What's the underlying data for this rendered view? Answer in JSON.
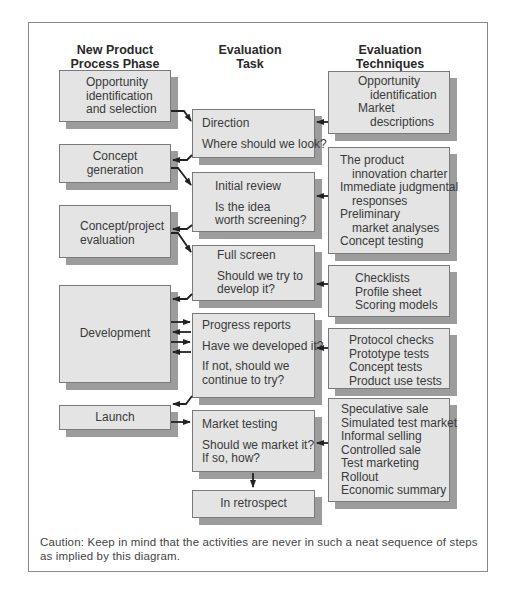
{
  "headers": {
    "phase": [
      "New Product",
      "Process Phase"
    ],
    "task": [
      "Evaluation",
      "Task"
    ],
    "techniques": [
      "Evaluation",
      "Techniques"
    ]
  },
  "phases": [
    {
      "id": "opportunity",
      "lines": [
        "Opportunity",
        "identification",
        "and selection"
      ]
    },
    {
      "id": "concept-generation",
      "lines": [
        "Concept",
        "generation"
      ]
    },
    {
      "id": "concept-project-evaluation",
      "lines": [
        "Concept/project",
        "evaluation"
      ]
    },
    {
      "id": "development",
      "lines": [
        "Development"
      ]
    },
    {
      "id": "launch",
      "lines": [
        "Launch"
      ]
    }
  ],
  "tasks": [
    {
      "id": "direction",
      "title": "Direction",
      "question": [
        "Where should we look?"
      ]
    },
    {
      "id": "initial-review",
      "title": "Initial review",
      "question": [
        "Is the idea",
        "worth screening?"
      ]
    },
    {
      "id": "full-screen",
      "title": "Full screen",
      "question": [
        "Should we try to",
        "develop it?"
      ]
    },
    {
      "id": "progress-reports",
      "title": "Progress reports",
      "question": [
        "Have we developed it?"
      ],
      "extra": [
        "If not, should we",
        "continue to try?"
      ]
    },
    {
      "id": "market-testing",
      "title": "Market testing",
      "question": [
        "Should we market it?",
        "If so, how?"
      ]
    },
    {
      "id": "in-retrospect",
      "title": "In retrospect"
    }
  ],
  "techniques": [
    {
      "id": "t1",
      "items": [
        {
          "text": "Opportunity",
          "indent": false
        },
        {
          "text": "identification",
          "indent": true
        },
        {
          "text": "Market",
          "indent": false
        },
        {
          "text": "descriptions",
          "indent": true
        }
      ]
    },
    {
      "id": "t2",
      "items": [
        {
          "text": "The product",
          "indent": false
        },
        {
          "text": "innovation charter",
          "indent": true
        },
        {
          "text": "Immediate judgmental",
          "indent": false
        },
        {
          "text": "responses",
          "indent": true
        },
        {
          "text": "Preliminary",
          "indent": false
        },
        {
          "text": "market analyses",
          "indent": true
        },
        {
          "text": "Concept testing",
          "indent": false
        }
      ]
    },
    {
      "id": "t3",
      "items": [
        "Checklists",
        "Profile sheet",
        "Scoring models"
      ]
    },
    {
      "id": "t4",
      "items": [
        "Protocol checks",
        "Prototype tests",
        "Concept tests",
        "Product use tests"
      ]
    },
    {
      "id": "t5",
      "items": [
        "Speculative sale",
        "Simulated test market",
        "Informal selling",
        "Controlled sale",
        "Test marketing",
        "Rollout",
        "Economic summary"
      ]
    }
  ],
  "caption": "Caution: Keep in mind that the activities are never in such a neat sequence of steps as implied by this diagram.",
  "colors": {
    "box_fill": "#e4e4e4",
    "box_border": "#7a7a7a",
    "shadow": "#9c9c9c",
    "arrow": "#222222"
  }
}
